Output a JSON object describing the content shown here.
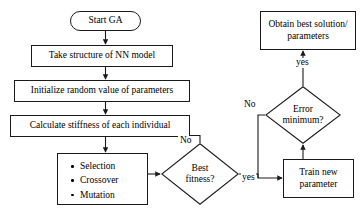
{
  "diagram": {
    "type": "flowchart",
    "stroke_color": "#1a1a1a",
    "fill_color": "#ffffff",
    "text_color": "#000000",
    "nodes": {
      "start": {
        "shape": "terminator",
        "text": "Start GA"
      },
      "take_structure": {
        "shape": "process",
        "text": "Take structure of NN model"
      },
      "initialize_random": {
        "shape": "process",
        "text": "Initialize random value of parameters"
      },
      "calculate_stiffness": {
        "shape": "process",
        "text": "Calculate stiffness of each individual"
      },
      "operators": {
        "shape": "process-list",
        "items": [
          "Selection",
          "Crossover",
          "Mutation"
        ]
      },
      "best_fitness": {
        "shape": "decision",
        "line1": "Best",
        "line2": "fitness?"
      },
      "train_new": {
        "shape": "process",
        "line1": "Train new",
        "line2": "parameter"
      },
      "error_minimum": {
        "shape": "decision",
        "line1": "Error",
        "line2": "minimum?"
      },
      "obtain_best": {
        "shape": "process",
        "line1": "Obtain best solution/",
        "line2": "parameters"
      }
    },
    "edge_labels": {
      "fitness_no": "No",
      "fitness_yes": "yes",
      "error_no": "No",
      "error_yes": "yes"
    }
  }
}
